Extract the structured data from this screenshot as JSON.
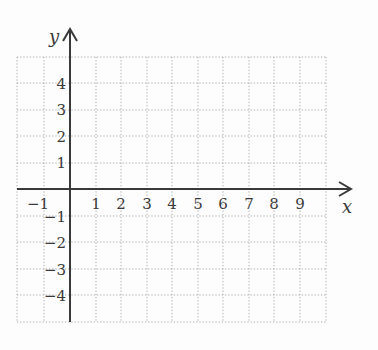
{
  "diagram": {
    "type": "coordinate-grid",
    "axes": {
      "x_label": "x",
      "y_label": "y",
      "x_range": [
        -2,
        10
      ],
      "y_range": [
        -5,
        5
      ]
    },
    "x_tick_labels": [
      "−1",
      "1",
      "2",
      "3",
      "4",
      "5",
      "6",
      "7",
      "8",
      "9"
    ],
    "y_tick_labels": [
      "4",
      "3",
      "2",
      "1",
      "−1",
      "−2",
      "−3",
      "−4"
    ],
    "colors": {
      "axis": "#3a3a3a",
      "grid": "#a8a8a8",
      "background": "#fdfdfd"
    }
  }
}
